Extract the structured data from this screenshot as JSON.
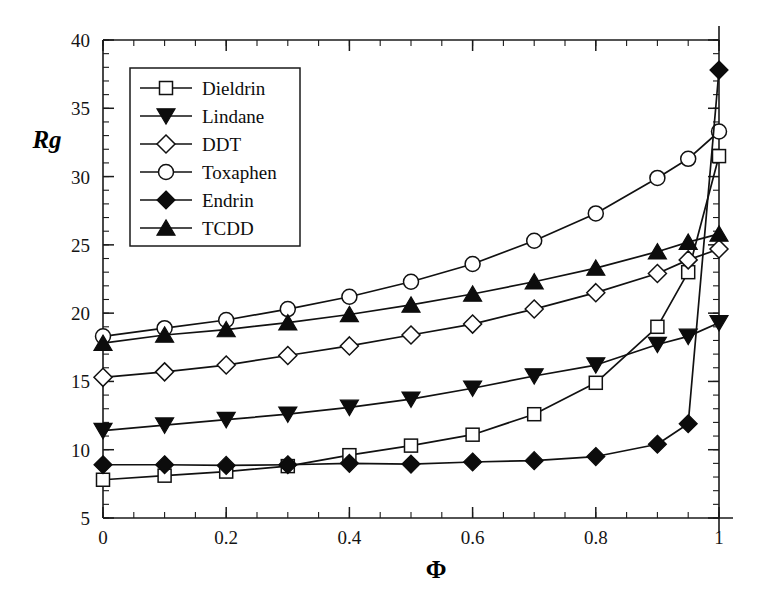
{
  "chart_data": {
    "type": "line",
    "title": "",
    "xlabel": "Φ",
    "ylabel": "Rg",
    "xlim": [
      0,
      1
    ],
    "ylim": [
      5,
      40
    ],
    "grid": false,
    "legend_position": "upper-left",
    "x_ticks": [
      {
        "value": 0,
        "label": "0"
      },
      {
        "value": 0.2,
        "label": "0.2"
      },
      {
        "value": 0.4,
        "label": "0.4"
      },
      {
        "value": 0.6,
        "label": "0.6"
      },
      {
        "value": 0.8,
        "label": "0.8"
      },
      {
        "value": 1,
        "label": "1"
      }
    ],
    "y_ticks": [
      {
        "value": 5,
        "label": "5"
      },
      {
        "value": 10,
        "label": "10"
      },
      {
        "value": 15,
        "label": "15"
      },
      {
        "value": 20,
        "label": "20"
      },
      {
        "value": 25,
        "label": "25"
      },
      {
        "value": 30,
        "label": "30"
      },
      {
        "value": 35,
        "label": "35"
      },
      {
        "value": 40,
        "label": "40"
      }
    ],
    "x_minor_step": 0.05,
    "y_minor_step": 1,
    "x": [
      0,
      0.1,
      0.2,
      0.3,
      0.4,
      0.5,
      0.6,
      0.7,
      0.8,
      0.9,
      0.95,
      1
    ],
    "series": [
      {
        "name": "Dieldrin",
        "marker": "square-open",
        "values": [
          7.8,
          8.1,
          8.4,
          8.8,
          9.6,
          10.3,
          11.1,
          12.6,
          14.9,
          19.0,
          23.0,
          31.5
        ]
      },
      {
        "name": "Lindane",
        "marker": "triangle-down-filled",
        "values": [
          11.4,
          11.8,
          12.2,
          12.6,
          13.1,
          13.7,
          14.5,
          15.4,
          16.2,
          17.7,
          18.3,
          19.3
        ]
      },
      {
        "name": "DDT",
        "marker": "diamond-open",
        "values": [
          15.3,
          15.7,
          16.2,
          16.9,
          17.6,
          18.4,
          19.2,
          20.3,
          21.5,
          22.9,
          23.9,
          24.7
        ]
      },
      {
        "name": "Toxaphen",
        "marker": "circle-open",
        "values": [
          18.3,
          18.9,
          19.5,
          20.3,
          21.2,
          22.3,
          23.6,
          25.3,
          27.3,
          29.9,
          31.3,
          33.3
        ]
      },
      {
        "name": "Endrin",
        "marker": "diamond-filled",
        "values": [
          8.9,
          8.9,
          8.85,
          8.9,
          9.0,
          8.95,
          9.1,
          9.2,
          9.5,
          10.4,
          11.9,
          37.8
        ]
      },
      {
        "name": "TCDD",
        "marker": "triangle-up-filled",
        "values": [
          17.8,
          18.4,
          18.8,
          19.3,
          19.9,
          20.6,
          21.4,
          22.3,
          23.3,
          24.5,
          25.2,
          25.8
        ]
      }
    ]
  },
  "legend": {
    "entries": [
      {
        "label": "Dieldrin"
      },
      {
        "label": "Lindane"
      },
      {
        "label": "DDT"
      },
      {
        "label": "Toxaphen"
      },
      {
        "label": "Endrin"
      },
      {
        "label": "TCDD"
      }
    ]
  }
}
